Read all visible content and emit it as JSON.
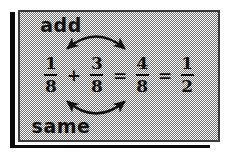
{
  "diagram": {
    "top_label": "add",
    "bottom_label": "same",
    "equation": {
      "terms": [
        {
          "kind": "fraction",
          "numerator": "1",
          "denominator": "8"
        },
        {
          "kind": "operator",
          "symbol": "+"
        },
        {
          "kind": "fraction",
          "numerator": "3",
          "denominator": "8"
        },
        {
          "kind": "operator",
          "symbol": "="
        },
        {
          "kind": "fraction",
          "numerator": "4",
          "denominator": "8"
        },
        {
          "kind": "operator",
          "symbol": "="
        },
        {
          "kind": "fraction",
          "numerator": "1",
          "denominator": "2"
        }
      ]
    },
    "annotations": {
      "top_arrow": "double-headed-arc-arrow-down",
      "bottom_arrow": "double-headed-arc-arrow-up"
    },
    "colors": {
      "ink": "#101010",
      "frame": "#3a3a3a",
      "shadow": "#0a0a0a",
      "mat": "#ffffff",
      "field_dither": "#6f6f6f",
      "page": "#ffffff"
    }
  }
}
